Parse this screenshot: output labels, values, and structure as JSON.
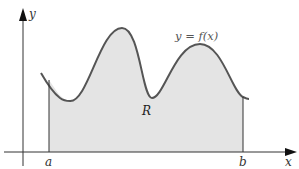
{
  "diagram": {
    "axes": {
      "x_label": "x",
      "y_label": "y"
    },
    "bounds": {
      "a_label": "a",
      "b_label": "b"
    },
    "curve_label": "y = f(x)",
    "region_label": "R",
    "colors": {
      "curve": "#555555",
      "region_fill": "#e4e4e4",
      "axes": "#333333",
      "background": "#ffffff"
    }
  }
}
